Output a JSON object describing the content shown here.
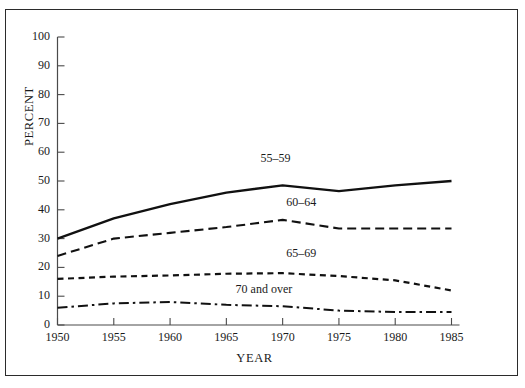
{
  "figure": {
    "top_clipped_text": "",
    "frame": true
  },
  "chart_data": {
    "type": "line",
    "title": "",
    "xlabel": "YEAR",
    "ylabel": "PERCENT",
    "x": [
      1950,
      1955,
      1960,
      1965,
      1970,
      1975,
      1980,
      1985
    ],
    "xlim": [
      1950,
      1985
    ],
    "ylim": [
      0,
      100
    ],
    "xticks": [
      "1950",
      "1955",
      "1960",
      "1965",
      "1970",
      "1975",
      "1980",
      "1985"
    ],
    "yticks": [
      "0",
      "10",
      "20",
      "30",
      "40",
      "50",
      "60",
      "70",
      "80",
      "90",
      "100"
    ],
    "grid": false,
    "legend_position": "inline-labels",
    "series": [
      {
        "name": "55–59",
        "label": "55–59",
        "style": "solid",
        "values": [
          30,
          37,
          42,
          46,
          48.5,
          46.5,
          48.5,
          50
        ],
        "label_x": 1968.2,
        "label_y": 57.5
      },
      {
        "name": "60–64",
        "label": "60–64",
        "style": "long-dash",
        "values": [
          24,
          30,
          32,
          34,
          36.5,
          33.5,
          33.5,
          33.5
        ],
        "label_x": 1970.5,
        "label_y": 42.5
      },
      {
        "name": "65–69",
        "label": "65–69",
        "style": "short-dash",
        "values": [
          16,
          16.8,
          17.2,
          17.8,
          18,
          17,
          15.5,
          12
        ],
        "label_x": 1970.5,
        "label_y": 24.5
      },
      {
        "name": "70 and over",
        "label": "70 and over",
        "style": "dash-dot",
        "values": [
          6,
          7.5,
          8,
          7,
          6.5,
          5,
          4.5,
          4.5
        ],
        "label_x": 1966.0,
        "label_y": 12.2
      }
    ]
  }
}
